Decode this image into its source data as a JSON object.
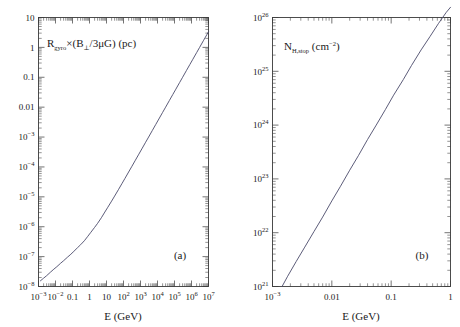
{
  "figure": {
    "background_color": "#ffffff",
    "ink_color": "#1a1a1a",
    "curve_color": "#4a4a6a"
  },
  "chart_data": [
    {
      "type": "line",
      "panel": "a",
      "panel_tag": "(a)",
      "title": "",
      "xlabel": "E  (GeV)",
      "ylabel": "R_gyro×(B⊥/3μG)  (pc)",
      "ylabel_parts": {
        "base": "R",
        "subscript": "gyro",
        "rest": "×(B⊥/3μG)  (pc)"
      },
      "xscale": "log",
      "yscale": "log",
      "xlim": [
        0.001,
        10000000
      ],
      "ylim": [
        1e-08,
        10
      ],
      "grid": false,
      "legend": "none",
      "xticks": [
        0.001,
        0.01,
        0.1,
        1,
        10,
        100,
        1000,
        10000,
        100000,
        1000000,
        10000000
      ],
      "xtick_labels": [
        "10-3",
        "10-2",
        "0.1",
        "1",
        "10",
        "102",
        "103",
        "104",
        "105",
        "106",
        "107"
      ],
      "yticks": [
        1e-08,
        1e-07,
        1e-06,
        1e-05,
        0.0001,
        0.001,
        0.01,
        0.1,
        1,
        10
      ],
      "ytick_labels": [
        "10-8",
        "10-7",
        "10-6",
        "10-5",
        "10-4",
        "10-3",
        "0.01",
        "0.1",
        "1",
        "10"
      ],
      "series": [
        {
          "name": "gyroradius",
          "x": [
            0.0013,
            0.002,
            0.003,
            0.005,
            0.008,
            0.012,
            0.02,
            0.03,
            0.05,
            0.08,
            0.12,
            0.2,
            0.3,
            0.5,
            0.8,
            1.2,
            2,
            3,
            5,
            8,
            12,
            20,
            30,
            50,
            80,
            120,
            200,
            300,
            500,
            800,
            1200,
            2000,
            3000,
            5000,
            8000,
            12000,
            20000,
            30000,
            50000,
            80000,
            120000,
            200000,
            300000,
            500000,
            800000,
            1200000,
            2000000,
            3000000,
            5000000,
            8000000,
            10000000
          ],
          "y": [
            1.55e-08,
            1.9e-08,
            2.3e-08,
            3e-08,
            3.8e-08,
            4.6e-08,
            6e-08,
            7.3e-08,
            9.5e-08,
            1.2e-07,
            1.5e-07,
            2e-07,
            2.5e-07,
            3.4e-07,
            4.8e-07,
            6.5e-07,
            9.5e-07,
            1.3e-06,
            2e-06,
            3.1e-06,
            4.5e-06,
            7.2e-06,
            1.06e-05,
            1.73e-05,
            2.74e-05,
            4.08e-05,
            6.76e-05,
            0.000101,
            0.000168,
            0.000268,
            0.000402,
            0.00067,
            0.001,
            0.00167,
            0.00267,
            0.00401,
            0.00668,
            0.01,
            0.0167,
            0.0267,
            0.04,
            0.0667,
            0.1,
            0.167,
            0.267,
            0.4,
            0.667,
            1.0,
            1.67,
            2.67,
            3.34
          ]
        }
      ]
    },
    {
      "type": "line",
      "panel": "b",
      "panel_tag": "(b)",
      "title": "",
      "xlabel": "E  (GeV)",
      "ylabel": "N_H,stop  (cm-2)",
      "ylabel_parts": {
        "base": "N",
        "subscript": "H,stop",
        "rest": "(cm-2)"
      },
      "xscale": "log",
      "yscale": "log",
      "xlim": [
        0.001,
        1
      ],
      "ylim": [
        1e+21,
        1e+26
      ],
      "grid": false,
      "legend": "none",
      "xticks": [
        0.001,
        0.01,
        0.1,
        1
      ],
      "xtick_labels": [
        "10-3",
        "0.01",
        "0.1",
        "1"
      ],
      "yticks": [
        1e+21,
        1e+22,
        1e+23,
        1e+24,
        1e+25,
        1e+26
      ],
      "ytick_labels": [
        "1021",
        "1022",
        "1023",
        "1024",
        "1025",
        "1026"
      ],
      "series": [
        {
          "name": "stopping-column",
          "x": [
            0.00145,
            0.0018,
            0.0025,
            0.0035,
            0.005,
            0.007,
            0.01,
            0.014,
            0.02,
            0.028,
            0.04,
            0.056,
            0.08,
            0.11,
            0.16,
            0.22,
            0.32,
            0.45,
            0.63,
            0.85,
            1.0
          ],
          "y": [
            1e+21,
            1.55e+21,
            2.9e+21,
            5.4e+21,
            1.05e+22,
            1.95e+22,
            3.9e+22,
            7.3e+22,
            1.45e+23,
            2.7e+23,
            5.4e+23,
            1e+24,
            1.95e+24,
            3.6e+24,
            7e+24,
            1.28e+25,
            2.5e+25,
            4.4e+25,
            7.8e+25,
            1.25e+26,
            1.55e+26
          ]
        }
      ]
    }
  ]
}
